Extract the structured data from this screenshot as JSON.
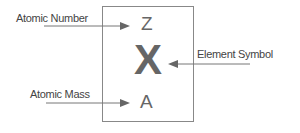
{
  "diagram": {
    "labels": {
      "atomic_number": "Atomic Number",
      "atomic_mass": "Atomic Mass",
      "element_symbol": "Element Symbol"
    },
    "box": {
      "top_symbol": "Z",
      "center_symbol": "X",
      "bottom_symbol": "A"
    },
    "colors": {
      "line": "#888888",
      "text": "#555555",
      "symbol": "#666666"
    }
  }
}
